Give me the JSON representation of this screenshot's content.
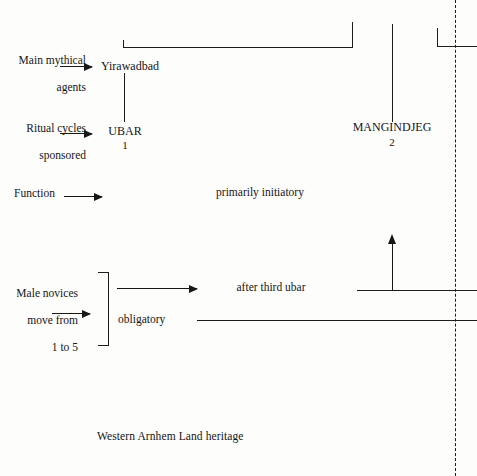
{
  "figure": {
    "caption": "Western Arnhem Land heritage",
    "ink_color": "#1d1d1d",
    "background": "#fdfdfc"
  },
  "row_labels": [
    {
      "id": "main-mythical-agents",
      "line1": "Main mythical",
      "line2": "agents"
    },
    {
      "id": "ritual-cycles-sponsored",
      "line1": "Ritual cycles",
      "line2": "sponsored"
    },
    {
      "id": "function",
      "line1": "Function",
      "line2": ""
    },
    {
      "id": "male-novices",
      "line1": "Male novices",
      "line2": "move from",
      "line3": "1 to 5"
    }
  ],
  "nodes": {
    "yirawadbad": {
      "label": "Yirawadbad"
    },
    "ubar": {
      "label": "UBAR",
      "number": "1"
    },
    "mangindjeg": {
      "label": "MANGINDJEG",
      "number": "2"
    }
  },
  "annotations": {
    "function_value": "primarily initiatory",
    "after_third_ubar": "after third ubar",
    "obligatory": "obligatory"
  }
}
